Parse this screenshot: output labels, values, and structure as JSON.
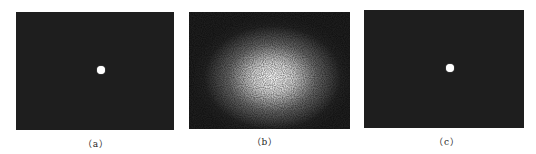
{
  "figure": {
    "panels": [
      {
        "id": "a",
        "caption": "（a）",
        "content": "dark field with small bright central spot"
      },
      {
        "id": "b",
        "caption": "（b）",
        "content": "speckle pattern with bright diffuse center"
      },
      {
        "id": "c",
        "caption": "（c）",
        "content": "dark field with small bright central spot"
      }
    ]
  }
}
